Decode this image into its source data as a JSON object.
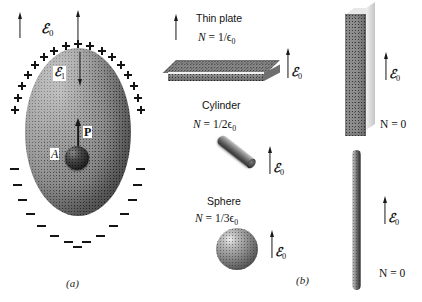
{
  "figure": {
    "panels": [
      {
        "id": "a",
        "label": "(a)"
      },
      {
        "id": "b",
        "label": "(b)"
      }
    ]
  },
  "panel_a": {
    "external_field_label": "ℰ",
    "external_field_sub": "0",
    "internal_field_label": "ℰ",
    "internal_field_sub": "1",
    "polarization_label": "P",
    "cavity_label": "A",
    "surface_charge_positive": "+",
    "surface_charge_negative": "−",
    "positive_charge_count": 17,
    "negative_charge_count": 15
  },
  "panel_b": {
    "shapes": [
      {
        "name": "Thin plate",
        "formula_lhs": "N",
        "formula_eq": "=",
        "formula_rhs": "1/ϵ",
        "formula_sub": "0",
        "field_label": "ℰ",
        "field_sub": "0"
      },
      {
        "name": "Cylinder",
        "formula_lhs": "N",
        "formula_eq": "=",
        "formula_rhs": "1/2ϵ",
        "formula_sub": "0",
        "field_label": "ℰ",
        "field_sub": "0"
      },
      {
        "name": "Sphere",
        "formula_lhs": "N",
        "formula_eq": "=",
        "formula_rhs": "1/3ϵ",
        "formula_sub": "0",
        "field_label": "ℰ",
        "field_sub": "0"
      }
    ],
    "right_column": [
      {
        "name": "long-slab",
        "formula": "N = 0",
        "field_label": "ℰ",
        "field_sub": "0"
      },
      {
        "name": "needle",
        "formula": "N = 0",
        "field_label": "ℰ",
        "field_sub": "0"
      }
    ]
  },
  "colors": {
    "ink": "#141414",
    "body_gray": "#8e8e8e",
    "dark_sphere": "#222222"
  }
}
